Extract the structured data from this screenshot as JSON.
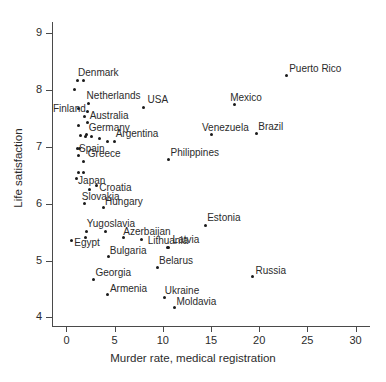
{
  "chart_data": {
    "type": "scatter",
    "title": "",
    "xlabel": "Murder rate, medical registration",
    "ylabel": "Life satisfaction",
    "xlim": [
      -1.5,
      31.5
    ],
    "ylim": [
      3.85,
      9.2
    ],
    "xticks": [
      0,
      5,
      10,
      15,
      20,
      25,
      30
    ],
    "yticks": [
      4,
      5,
      6,
      7,
      8,
      9
    ],
    "grid": false,
    "legend": null,
    "points": [
      {
        "label": "Denmark",
        "x": 1.1,
        "y": 8.17,
        "label_dx": 1,
        "label_dy": -13
      },
      {
        "label": "",
        "x": 1.8,
        "y": 8.17,
        "label_dx": 0,
        "label_dy": 0
      },
      {
        "label": "",
        "x": 0.8,
        "y": 8.01,
        "label_dx": 0,
        "label_dy": 0
      },
      {
        "label": "Netherlands",
        "x": 2.3,
        "y": 7.76,
        "label_dx": -2,
        "label_dy": -13
      },
      {
        "label": "Finland",
        "x": 1.3,
        "y": 7.68,
        "label_dx": -26,
        "label_dy": -4
      },
      {
        "label": "Australia",
        "x": 2.2,
        "y": 7.62,
        "label_dx": 2,
        "label_dy": -1
      },
      {
        "label": "",
        "x": 1.9,
        "y": 7.54,
        "label_dx": 0,
        "label_dy": 0
      },
      {
        "label": "",
        "x": 2.2,
        "y": 7.44,
        "label_dx": 0,
        "label_dy": 0
      },
      {
        "label": "",
        "x": 1.3,
        "y": 7.37,
        "label_dx": 0,
        "label_dy": 0
      },
      {
        "label": "USA",
        "x": 8.0,
        "y": 7.7,
        "label_dx": 4,
        "label_dy": -12
      },
      {
        "label": "Germany",
        "x": 2.1,
        "y": 7.22,
        "label_dx": 2,
        "label_dy": -12
      },
      {
        "label": "",
        "x": 1.5,
        "y": 7.2,
        "label_dx": 0,
        "label_dy": 0
      },
      {
        "label": "",
        "x": 2.0,
        "y": 7.18,
        "label_dx": 0,
        "label_dy": 0
      },
      {
        "label": "",
        "x": 2.6,
        "y": 7.19,
        "label_dx": 0,
        "label_dy": 0
      },
      {
        "label": "",
        "x": 3.4,
        "y": 7.15,
        "label_dx": 0,
        "label_dy": 0
      },
      {
        "label": "Argentina",
        "x": 5.0,
        "y": 7.1,
        "label_dx": 1,
        "label_dy": -12
      },
      {
        "label": "",
        "x": 4.3,
        "y": 7.09,
        "label_dx": 0,
        "label_dy": 0
      },
      {
        "label": "Spain",
        "x": 1.1,
        "y": 6.98,
        "label_dx": 2,
        "label_dy": -4
      },
      {
        "label": "",
        "x": 1.4,
        "y": 6.98,
        "label_dx": 0,
        "label_dy": 0
      },
      {
        "label": "",
        "x": 1.3,
        "y": 6.85,
        "label_dx": 0,
        "label_dy": 0
      },
      {
        "label": "Greece",
        "x": 1.8,
        "y": 6.75,
        "label_dx": 4,
        "label_dy": -12
      },
      {
        "label": "Philippines",
        "x": 10.6,
        "y": 6.78,
        "label_dx": 2,
        "label_dy": -12
      },
      {
        "label": "",
        "x": 1.3,
        "y": 6.56,
        "label_dx": 0,
        "label_dy": 0
      },
      {
        "label": "",
        "x": 1.8,
        "y": 6.56,
        "label_dx": 0,
        "label_dy": 0
      },
      {
        "label": "Japan",
        "x": 1.0,
        "y": 6.45,
        "label_dx": 2,
        "label_dy": -2
      },
      {
        "label": "Croatia",
        "x": 3.1,
        "y": 6.33,
        "label_dx": 3,
        "label_dy": -2
      },
      {
        "label": "",
        "x": 2.4,
        "y": 6.25,
        "label_dx": 0,
        "label_dy": 0
      },
      {
        "label": "Venezuela",
        "x": 15.0,
        "y": 7.22,
        "label_dx": -9,
        "label_dy": -12
      },
      {
        "label": "Mexico",
        "x": 17.4,
        "y": 7.74,
        "label_dx": -4,
        "label_dy": -12
      },
      {
        "label": "Brazil",
        "x": 19.7,
        "y": 7.23,
        "label_dx": 2,
        "label_dy": -12
      },
      {
        "label": "Puerto Rico",
        "x": 22.8,
        "y": 8.25,
        "label_dx": 3,
        "label_dy": -12
      },
      {
        "label": "Slovakia",
        "x": 1.9,
        "y": 6.0,
        "label_dx": -3,
        "label_dy": -12
      },
      {
        "label": "Hungary",
        "x": 3.8,
        "y": 5.93,
        "label_dx": 2,
        "label_dy": -11
      },
      {
        "label": "Yugoslavia",
        "x": 2.1,
        "y": 5.52,
        "label_dx": 0,
        "label_dy": -12
      },
      {
        "label": "",
        "x": 4.0,
        "y": 5.52,
        "label_dx": 0,
        "label_dy": 0
      },
      {
        "label": "Egypt",
        "x": 0.5,
        "y": 5.35,
        "label_dx": 3,
        "label_dy": -3
      },
      {
        "label": "",
        "x": 2.0,
        "y": 5.4,
        "label_dx": 0,
        "label_dy": 0
      },
      {
        "label": "Azerbaijan",
        "x": 5.9,
        "y": 5.4,
        "label_dx": 0,
        "label_dy": -11
      },
      {
        "label": "",
        "x": 7.8,
        "y": 5.38,
        "label_dx": 0,
        "label_dy": 0
      },
      {
        "label": "Lithuania",
        "x": 10.5,
        "y": 5.24,
        "label_dx": -20,
        "label_dy": -11
      },
      {
        "label": "Latvia",
        "x": 10.6,
        "y": 5.24,
        "label_dx": 4,
        "label_dy": -12
      },
      {
        "label": "Bulgaria",
        "x": 4.4,
        "y": 5.07,
        "label_dx": 1,
        "label_dy": -11
      },
      {
        "label": "Belarus",
        "x": 9.4,
        "y": 4.88,
        "label_dx": 2,
        "label_dy": -11
      },
      {
        "label": "Estonia",
        "x": 14.4,
        "y": 5.62,
        "label_dx": 2,
        "label_dy": -12
      },
      {
        "label": "Georgia",
        "x": 2.8,
        "y": 4.67,
        "label_dx": 2,
        "label_dy": -11
      },
      {
        "label": "Armenia",
        "x": 4.3,
        "y": 4.4,
        "label_dx": 2,
        "label_dy": -11
      },
      {
        "label": "Ukraine",
        "x": 10.2,
        "y": 4.36,
        "label_dx": 0,
        "label_dy": -11
      },
      {
        "label": "Moldavia",
        "x": 11.2,
        "y": 4.17,
        "label_dx": 2,
        "label_dy": -11
      },
      {
        "label": "Russia",
        "x": 19.3,
        "y": 4.72,
        "label_dx": 3,
        "label_dy": -11
      }
    ]
  }
}
